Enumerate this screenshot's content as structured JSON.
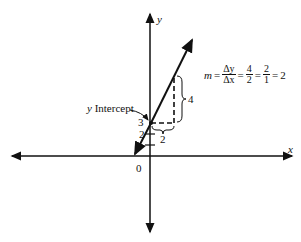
{
  "diagram": {
    "axes": {
      "x_label": "x",
      "y_label": "y",
      "origin_label": "0"
    },
    "line": {
      "slope": 2,
      "y_intercept": 3
    },
    "annotations": {
      "y_intercept_label": "y Intercept",
      "intercept_value": "3",
      "tick_label": "2",
      "rise_label": "4",
      "run_label": "2"
    },
    "slope_formula": {
      "m": "m",
      "eq": "=",
      "dy": "Δy",
      "dx": "Δx",
      "frac1_num": "4",
      "frac1_den": "2",
      "frac2_num": "2",
      "frac2_den": "1",
      "result": "2"
    }
  }
}
